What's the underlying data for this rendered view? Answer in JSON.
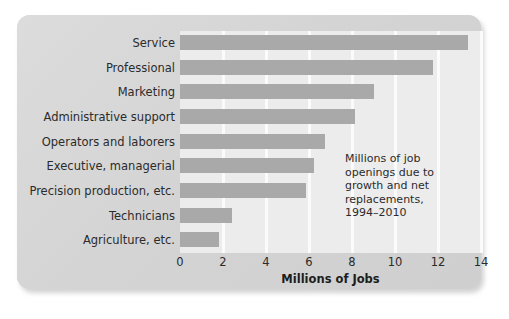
{
  "chart_data": {
    "type": "bar",
    "orientation": "horizontal",
    "title": "",
    "xlabel": "Millions of Jobs",
    "ylabel": "",
    "xlim": [
      0,
      14
    ],
    "xticks": [
      "0",
      "2",
      "4",
      "6",
      "8",
      "10",
      "12",
      "14"
    ],
    "grid": "vertical",
    "legend": "none",
    "categories": [
      "Service",
      "Professional",
      "Marketing",
      "Administrative support",
      "Operators and laborers",
      "Executive, managerial",
      "Precision production, etc.",
      "Technicians",
      "Agriculture, etc."
    ],
    "values": [
      13.4,
      11.75,
      9.0,
      8.15,
      6.75,
      6.25,
      5.85,
      2.4,
      1.8
    ],
    "annotation_lines": [
      "Millions of job",
      "openings due to",
      "growth and net",
      "replacements,",
      "1994–2010"
    ],
    "colors": {
      "bar": "#a9a9a9",
      "panel": "#ececec",
      "card": "#d7d7d7",
      "gridline": "#fbfbfb",
      "text": "#2b2b2b"
    }
  }
}
